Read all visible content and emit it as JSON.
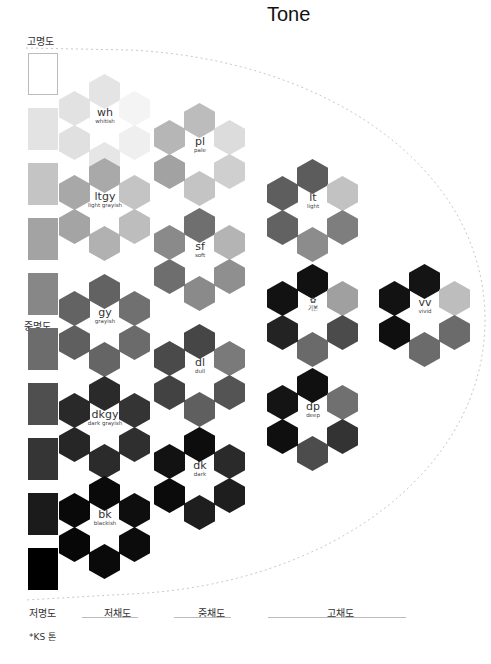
{
  "title": "Tone",
  "axes": {
    "lightness_high": "고명도",
    "lightness_mid": "중명도",
    "lightness_low": "저명도",
    "chroma_low": "저채도",
    "chroma_mid": "중채도",
    "chroma_high": "고채도"
  },
  "footnote": "*KS 톤",
  "lightness_scale": [
    "#ffffff",
    "#e3e3e3",
    "#c4c4c4",
    "#a3a3a3",
    "#878787",
    "#6c6c6c",
    "#4f4f4f",
    "#353535",
    "#1b1b1b",
    "#000000"
  ],
  "clusters": {
    "wh": {
      "code": "wh",
      "name": "whitish",
      "colors": [
        "#e4e4e4",
        "#f4f4f4",
        "#efefef",
        "#e6e6e6",
        "#e0e0e0",
        "#e2e2e2"
      ]
    },
    "ltgy": {
      "code": "ltgy",
      "name": "light grayish",
      "colors": [
        "#a9a9a9",
        "#c4c4c4",
        "#bdbdbd",
        "#b1b1b1",
        "#a4a4a4",
        "#a8a8a8"
      ]
    },
    "gy": {
      "code": "gy",
      "name": "grayish",
      "colors": [
        "#626262",
        "#707070",
        "#6b6b6b",
        "#656565",
        "#5f5f5f",
        "#636363"
      ]
    },
    "dkgy": {
      "code": "dkgy",
      "name": "dark grayish",
      "colors": [
        "#2a2a2a",
        "#343434",
        "#2f2f2f",
        "#2b2b2b",
        "#262626",
        "#292929"
      ]
    },
    "bk": {
      "code": "bk",
      "name": "blackish",
      "colors": [
        "#0a0a0a",
        "#0e0e0e",
        "#0c0c0c",
        "#0a0a0a",
        "#070707",
        "#090909"
      ]
    },
    "pl": {
      "code": "pl",
      "name": "pale",
      "colors": [
        "#bcbcbc",
        "#dcdcdc",
        "#cfcfcf",
        "#c4c4c4",
        "#a2a2a2",
        "#b6b6b6"
      ]
    },
    "sf": {
      "code": "sf",
      "name": "soft",
      "colors": [
        "#6f6f6f",
        "#b4b4b4",
        "#8f8f8f",
        "#8a8a8a",
        "#6e6e6e",
        "#8a8a8a"
      ]
    },
    "dl": {
      "code": "dl",
      "name": "dull",
      "colors": [
        "#464646",
        "#7a7a7a",
        "#545454",
        "#5f5f5f",
        "#424242",
        "#4a4a4a"
      ]
    },
    "dk": {
      "code": "dk",
      "name": "dark",
      "colors": [
        "#0d0d0d",
        "#2a2a2a",
        "#1e1e1e",
        "#1e1e1e",
        "#0b0b0b",
        "#121212"
      ]
    },
    "lt": {
      "code": "lt",
      "name": "light",
      "colors": [
        "#5c5c5c",
        "#c2c2c2",
        "#7e7e7e",
        "#8c8c8c",
        "#626262",
        "#5e5e5e"
      ]
    },
    "basic": {
      "code": "✿",
      "name": "기본",
      "colors": [
        "#111111",
        "#a0a0a0",
        "#4b4b4b",
        "#6a6a6a",
        "#232323",
        "#121212"
      ]
    },
    "dp": {
      "code": "dp",
      "name": "deep",
      "colors": [
        "#101010",
        "#707070",
        "#333333",
        "#4c4c4c",
        "#0f0f0f",
        "#141414"
      ]
    },
    "vv": {
      "code": "vv",
      "name": "vivid",
      "colors": [
        "#141414",
        "#bdbdbd",
        "#6b6b6b",
        "#6b6b6b",
        "#0f0f0f",
        "#121212"
      ]
    }
  }
}
